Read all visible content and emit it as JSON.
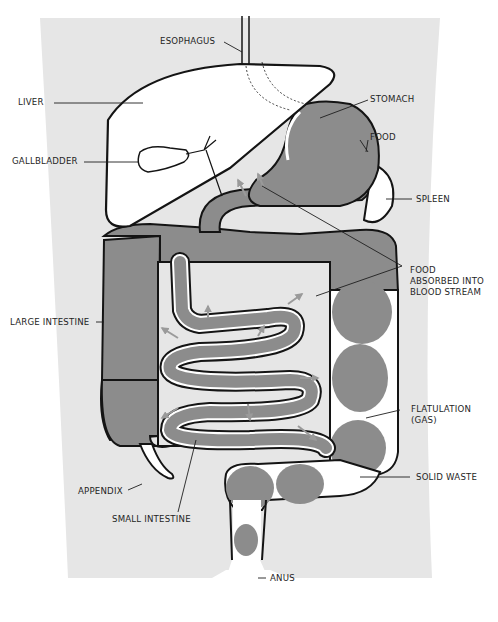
{
  "diagram": {
    "colors": {
      "background": "#ffffff",
      "body": "#e6e6e6",
      "organ_fill": "#8c8c8c",
      "organ_light": "#ffffff",
      "outline": "#141414",
      "arrow": "#9a9a9a"
    },
    "labels": {
      "esophagus": "ESOPHAGUS",
      "liver": "LIVER",
      "stomach": "STOMACH",
      "food": "FOOD",
      "gallbladder": "GALLBLADDER",
      "spleen": "SPLEEN",
      "food_absorbed_1": "FOOD",
      "food_absorbed_2": "ABSORBED INTO",
      "food_absorbed_3": "BLOOD STREAM",
      "large_intestine": "LARGE INTESTINE",
      "flatulation_1": "FLATULATION",
      "flatulation_2": "(GAS)",
      "solid_waste": "SOLID WASTE",
      "appendix": "APPENDIX",
      "small_intestine": "SMALL INTESTINE",
      "anus": "ANUS"
    }
  }
}
